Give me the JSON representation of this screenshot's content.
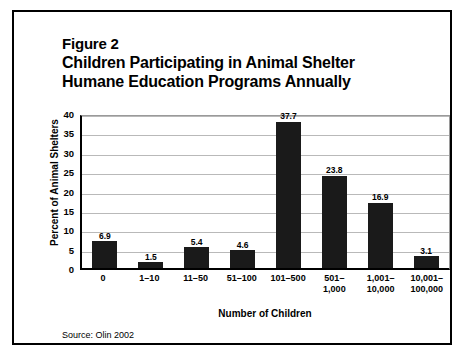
{
  "figure": {
    "number_label": "Figure 2",
    "title_line_1": "Children Participating in Animal Shelter",
    "title_line_2": "Humane Education Programs Annually",
    "source": "Source: Olin 2002",
    "border_color": "#000000"
  },
  "chart_data": {
    "type": "bar",
    "title": "Children Participating in Animal Shelter Humane Education Programs Annually",
    "subtitle": "Figure 2",
    "xlabel": "Number of Children",
    "ylabel": "Percent of Animal Shelters",
    "categories": [
      "0",
      "1–10",
      "11–50",
      "51–100",
      "101–500",
      "501–\n1,000",
      "1,001–\n10,000",
      "10,001–\n100,000"
    ],
    "values": [
      6.9,
      1.5,
      5.4,
      4.6,
      37.7,
      23.8,
      16.9,
      3.1
    ],
    "value_labels": [
      "6.9",
      "1.5",
      "5.4",
      "4.6",
      "37.7",
      "23.8",
      "16.9",
      "3.1"
    ],
    "ylim": [
      0,
      40
    ],
    "yticks": [
      0,
      5,
      10,
      15,
      20,
      25,
      30,
      35,
      40
    ],
    "ytick_labels": [
      "0",
      "5",
      "10",
      "15",
      "20",
      "25",
      "30",
      "35",
      "40"
    ],
    "grid": true,
    "legend": null,
    "bar_color": "#1a1a1a",
    "gridline_color": "#b9b9b9",
    "axis_color": "#000000",
    "annotation": "Source: Olin 2002"
  }
}
